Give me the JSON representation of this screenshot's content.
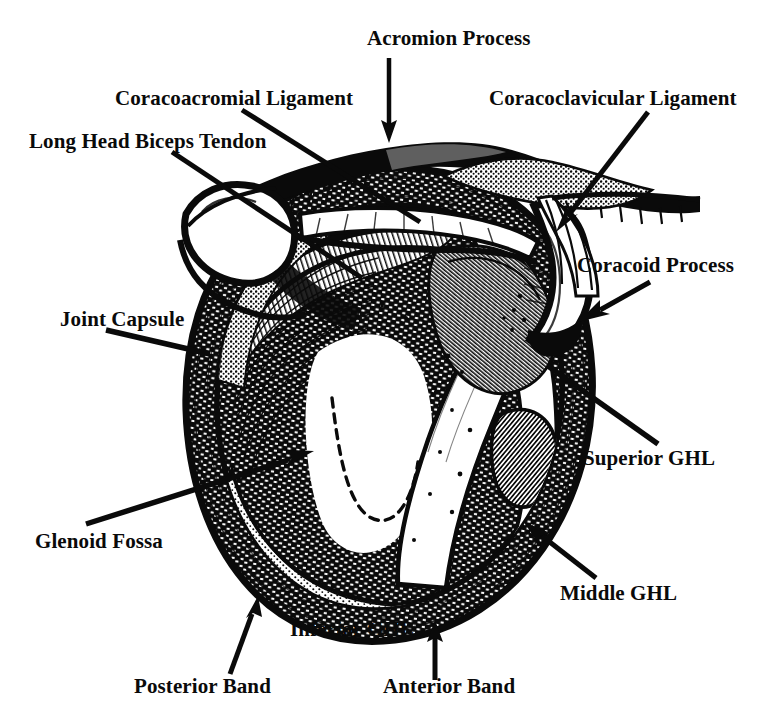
{
  "figure": {
    "type": "anatomical-line-drawing",
    "ink_color": "#0a0a0a",
    "background_color": "#ffffff",
    "width": 783,
    "height": 725
  },
  "labels": {
    "acromion_process": "Acromion Process",
    "coracoacromial_ligament": "Coracoacromial Ligament",
    "coracoclavicular_ligament": "Coracoclavicular Ligament",
    "long_head_biceps_tendon": "Long Head Biceps Tendon",
    "coracoid_process": "Coracoid Process",
    "joint_capsule": "Joint Capsule",
    "superior_ghl": "Superior GHL",
    "glenoid_fossa": "Glenoid Fossa",
    "middle_ghl": "Middle GHL",
    "inferior_ghl": "Inferior GHL",
    "posterior_band": "Posterior Band",
    "anterior_band": "Anterior Band"
  }
}
